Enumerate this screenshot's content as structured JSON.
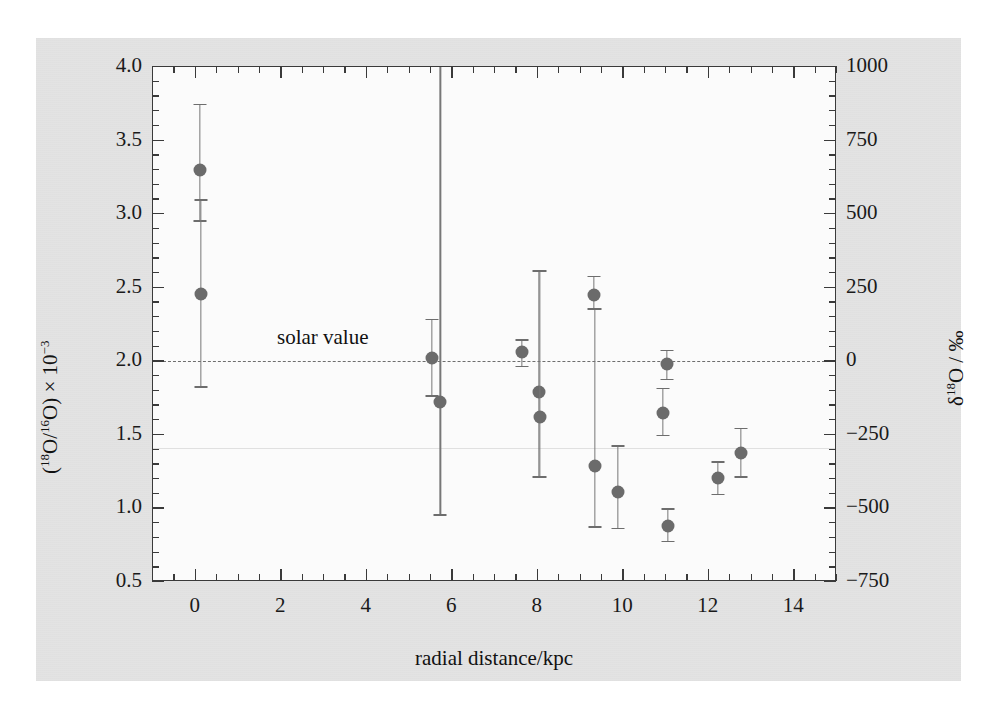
{
  "chart_data": {
    "type": "scatter",
    "title": "",
    "xlabel": "radial distance/kpc",
    "ylabel": "(18O/16O) × 10−3",
    "ylabel_right": "δ18O / ‰",
    "xlim": [
      -1,
      15
    ],
    "ylim": [
      0.5,
      4.0
    ],
    "ylim_right": [
      -750,
      1000
    ],
    "grid": false,
    "legend": null,
    "xticks": [
      0,
      2,
      4,
      6,
      8,
      10,
      12,
      14
    ],
    "xticklabels": [
      "0",
      "2",
      "4",
      "6",
      "8",
      "10",
      "12",
      "14"
    ],
    "xticks_minor_step": 0.5,
    "yticks": [
      0.5,
      1.0,
      1.5,
      2.0,
      2.5,
      3.0,
      3.5,
      4.0
    ],
    "yticklabels": [
      "0.5",
      "1.0",
      "1.5",
      "2.0",
      "2.5",
      "3.0",
      "3.5",
      "4.0"
    ],
    "yticks_minor_step": 0.1,
    "yticks_right": [
      -750,
      -500,
      -250,
      0,
      250,
      500,
      750,
      1000
    ],
    "yticklabels_right": [
      "−750",
      "−500",
      "−250",
      "0",
      "250",
      "500",
      "750",
      "1000"
    ],
    "yticks_right_minor_step": 50,
    "reference_line": {
      "label": "solar value",
      "y": 2.0,
      "style": "dashed",
      "color": "#6e6e6e"
    },
    "marker_color": "#6b6b6b",
    "errorbar_color": "#777777",
    "points": [
      {
        "x": 0.1,
        "y": 3.3,
        "ylow": 2.96,
        "yhigh": 3.75
      },
      {
        "x": 0.12,
        "y": 2.46,
        "ylow": 1.83,
        "yhigh": 3.1
      },
      {
        "x": 5.52,
        "y": 2.02,
        "ylow": 1.77,
        "yhigh": 2.29
      },
      {
        "x": 5.72,
        "y": 1.72,
        "ylow": 0.96,
        "yhigh": 4.05
      },
      {
        "x": 7.62,
        "y": 2.06,
        "ylow": 1.97,
        "yhigh": 2.15
      },
      {
        "x": 8.02,
        "y": 1.79,
        "ylow": 1.22,
        "yhigh": 2.62
      },
      {
        "x": 8.05,
        "y": 1.62,
        "ylow": 1.22,
        "yhigh": 2.62
      },
      {
        "x": 9.32,
        "y": 2.45,
        "ylow": 2.36,
        "yhigh": 2.58
      },
      {
        "x": 9.34,
        "y": 1.29,
        "ylow": 0.88,
        "yhigh": 2.36
      },
      {
        "x": 9.88,
        "y": 1.11,
        "ylow": 0.87,
        "yhigh": 1.43
      },
      {
        "x": 10.92,
        "y": 1.65,
        "ylow": 1.5,
        "yhigh": 1.82
      },
      {
        "x": 11.02,
        "y": 1.98,
        "ylow": 1.88,
        "yhigh": 2.08
      },
      {
        "x": 11.05,
        "y": 0.88,
        "ylow": 0.78,
        "yhigh": 1.0
      },
      {
        "x": 12.22,
        "y": 1.21,
        "ylow": 1.1,
        "yhigh": 1.32
      },
      {
        "x": 12.75,
        "y": 1.38,
        "ylow": 1.22,
        "yhigh": 1.55
      }
    ]
  }
}
